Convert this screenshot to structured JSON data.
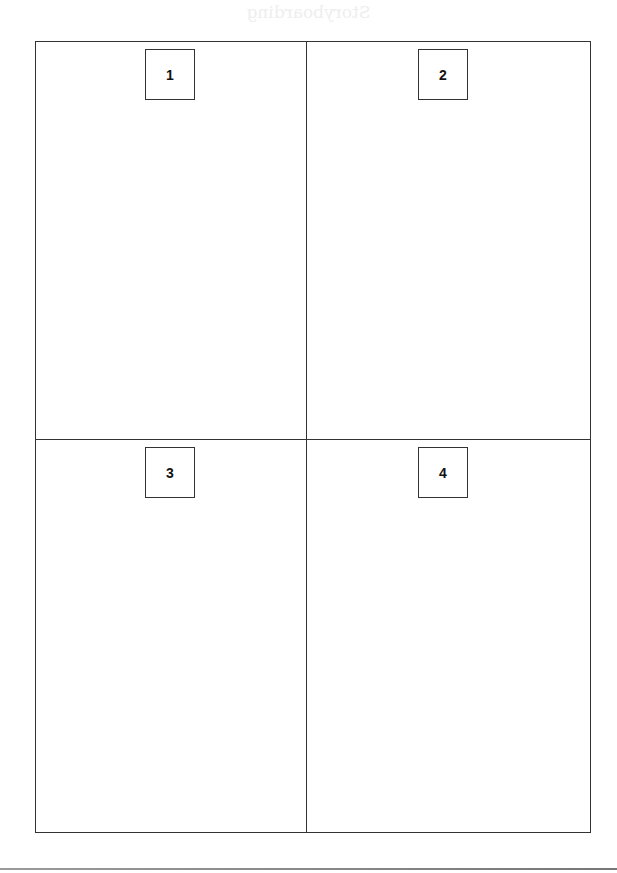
{
  "page": {
    "ghost_title": "Storyboarding"
  },
  "panels": [
    {
      "number": "1"
    },
    {
      "number": "2"
    },
    {
      "number": "3"
    },
    {
      "number": "4"
    }
  ],
  "colors": {
    "border": "#333333",
    "background": "#ffffff"
  }
}
